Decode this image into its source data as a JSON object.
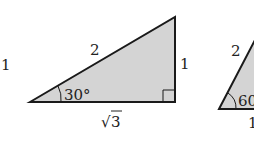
{
  "diagram": {
    "left_label": "1",
    "triangle1": {
      "hypotenuse": "2",
      "vertical_side": "1",
      "base": "3",
      "base_radical": "√",
      "angle": "30°"
    },
    "triangle2": {
      "hypotenuse": "2",
      "angle": "60°",
      "base": "1"
    },
    "colors": {
      "fill": "#d4d4d4",
      "stroke": "#1a1a1a"
    }
  }
}
